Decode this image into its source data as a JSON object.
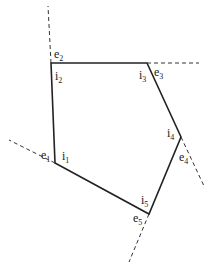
{
  "diagram": {
    "type": "pentagon-with-edge-extensions",
    "vertices": [
      {
        "id": "v1",
        "x": 55,
        "y": 163,
        "exterior_label": {
          "base": "e",
          "sub": "1"
        },
        "interior_label": {
          "base": "i",
          "sub": "1"
        }
      },
      {
        "id": "v2",
        "x": 51,
        "y": 63,
        "exterior_label": {
          "base": "e",
          "sub": "2"
        },
        "interior_label": {
          "base": "i",
          "sub": "2"
        }
      },
      {
        "id": "v3",
        "x": 147,
        "y": 63,
        "exterior_label": {
          "base": "e",
          "sub": "3"
        },
        "interior_label": {
          "base": "i",
          "sub": "3"
        }
      },
      {
        "id": "v4",
        "x": 181,
        "y": 137,
        "exterior_label": {
          "base": "e",
          "sub": "4"
        },
        "interior_label": {
          "base": "i",
          "sub": "4"
        }
      },
      {
        "id": "v5",
        "x": 149,
        "y": 214,
        "exterior_label": {
          "base": "e",
          "sub": "5"
        },
        "interior_label": {
          "base": "i",
          "sub": "5"
        }
      }
    ],
    "extensions": [
      {
        "from": "v1",
        "to_x": 9,
        "to_y": 140
      },
      {
        "from": "v2",
        "to_x": 48,
        "to_y": 6
      },
      {
        "from": "v3",
        "to_x": 199,
        "to_y": 63
      },
      {
        "from": "v4",
        "to_x": 204,
        "to_y": 186
      },
      {
        "from": "v5",
        "to_x": 129,
        "to_y": 262
      }
    ],
    "labels": {
      "e1": {
        "base": "e",
        "sub": "1"
      },
      "i1": {
        "base": "i",
        "sub": "1"
      },
      "e2": {
        "base": "e",
        "sub": "2"
      },
      "i2": {
        "base": "i",
        "sub": "2"
      },
      "e3": {
        "base": "e",
        "sub": "3"
      },
      "i3": {
        "base": "i",
        "sub": "3"
      },
      "e4": {
        "base": "e",
        "sub": "4"
      },
      "i4": {
        "base": "i",
        "sub": "4"
      },
      "e5": {
        "base": "e",
        "sub": "5"
      },
      "i5": {
        "base": "i",
        "sub": "5"
      }
    }
  }
}
